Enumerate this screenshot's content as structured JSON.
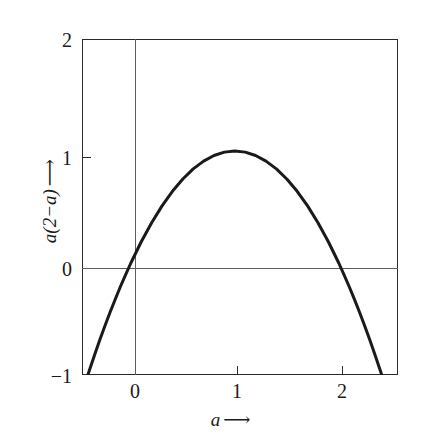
{
  "figure": {
    "background_color": "#ffffff",
    "frame_color": "#2b2b2b",
    "curve_color": "#1a1a1a",
    "reference_line_color": "#5c5c5c"
  },
  "axes": {
    "x_title": "a",
    "x_title_arrow": "⟶",
    "y_title": "a(2−a)",
    "y_title_arrow": "⟶",
    "x_ticks": [
      "0",
      "1",
      "2"
    ],
    "y_ticks": [
      "2",
      "1",
      "0",
      "−1"
    ]
  },
  "chart_data": {
    "type": "line",
    "title": "",
    "subtitle": "",
    "xlabel": "a ⟶",
    "ylabel": "a(2−a) ⟶",
    "equation": "y = a(2 − a)",
    "xlim": [
      -0.47,
      2.57
    ],
    "ylim": [
      -1,
      2
    ],
    "xticks": [
      0,
      1,
      2
    ],
    "yticks": [
      -1,
      0,
      1,
      2
    ],
    "xtick_labels": [
      "0",
      "1",
      "2"
    ],
    "ytick_labels": [
      "−1",
      "0",
      "1",
      "2"
    ],
    "grid": false,
    "legend": null,
    "reference_lines": [
      {
        "axis": "y",
        "value": 0
      },
      {
        "axis": "x",
        "value": 0
      }
    ],
    "annotations": [],
    "series": [
      {
        "name": "a(2−a)",
        "color": "#1a1a1a",
        "linewidth": 3,
        "x": [
          -0.41,
          -0.35,
          -0.3,
          -0.25,
          -0.2,
          -0.15,
          -0.1,
          -0.05,
          0.0,
          0.1,
          0.2,
          0.3,
          0.4,
          0.5,
          0.6,
          0.7,
          0.8,
          0.9,
          1.0,
          1.1,
          1.2,
          1.3,
          1.4,
          1.5,
          1.6,
          1.7,
          1.8,
          1.9,
          2.0,
          2.05,
          2.1,
          2.15,
          2.2,
          2.25,
          2.3,
          2.35,
          2.41
        ],
        "y": [
          -0.988,
          -0.823,
          -0.69,
          -0.563,
          -0.44,
          -0.323,
          -0.21,
          -0.103,
          0.0,
          0.19,
          0.36,
          0.51,
          0.64,
          0.75,
          0.84,
          0.91,
          0.96,
          0.99,
          1.0,
          0.99,
          0.96,
          0.91,
          0.84,
          0.75,
          0.64,
          0.51,
          0.36,
          0.19,
          0.0,
          -0.103,
          -0.21,
          -0.323,
          -0.44,
          -0.563,
          -0.69,
          -0.823,
          -0.988
        ],
        "key_points": [
          {
            "label": "root",
            "x": 0,
            "y": 0
          },
          {
            "label": "vertex",
            "x": 1,
            "y": 1
          },
          {
            "label": "root",
            "x": 2,
            "y": 0
          }
        ]
      }
    ]
  }
}
